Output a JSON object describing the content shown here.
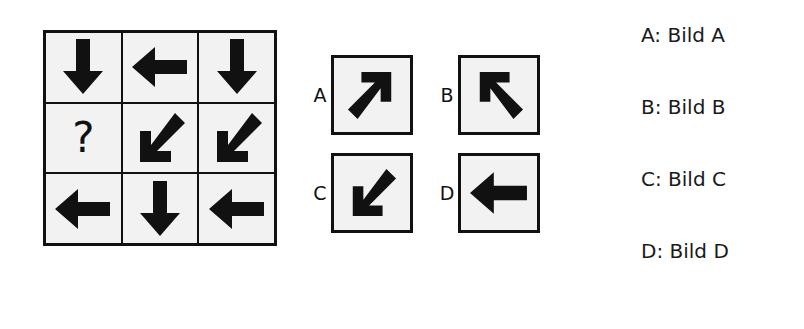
{
  "puzzle": {
    "type": "matrix-reasoning",
    "matrix": {
      "rows": 3,
      "cols": 3,
      "cells": [
        {
          "id": "r1c1",
          "content": "arrow",
          "direction": "down",
          "symbol": ""
        },
        {
          "id": "r1c2",
          "content": "arrow",
          "direction": "left",
          "symbol": ""
        },
        {
          "id": "r1c3",
          "content": "arrow",
          "direction": "down",
          "symbol": ""
        },
        {
          "id": "r2c1",
          "content": "question",
          "direction": "",
          "symbol": "?"
        },
        {
          "id": "r2c2",
          "content": "arrow",
          "direction": "down-left",
          "symbol": ""
        },
        {
          "id": "r2c3",
          "content": "arrow",
          "direction": "down-left",
          "symbol": ""
        },
        {
          "id": "r3c1",
          "content": "arrow",
          "direction": "left",
          "symbol": ""
        },
        {
          "id": "r3c2",
          "content": "arrow",
          "direction": "down",
          "symbol": ""
        },
        {
          "id": "r3c3",
          "content": "arrow",
          "direction": "left",
          "symbol": ""
        }
      ]
    },
    "options": [
      {
        "letter": "A",
        "direction": "up-right"
      },
      {
        "letter": "B",
        "direction": "up-left"
      },
      {
        "letter": "C",
        "direction": "down-left"
      },
      {
        "letter": "D",
        "direction": "left"
      }
    ],
    "answer_list": [
      {
        "label": "A: Bild A"
      },
      {
        "label": "B: Bild B"
      },
      {
        "label": "C: Bild C"
      },
      {
        "label": "D: Bild D"
      }
    ],
    "colors": {
      "ink": "#111111",
      "cell_background": "#f2f2f2",
      "page_background": "#ffffff"
    }
  }
}
